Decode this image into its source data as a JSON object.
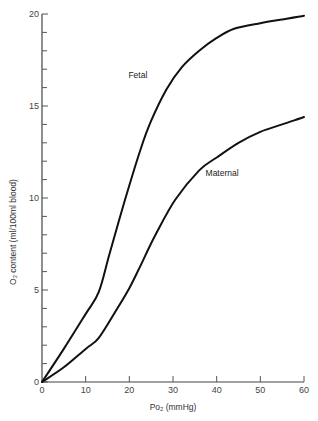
{
  "chart_data": {
    "type": "line",
    "title": "",
    "xlabel": "Po₂ (mmHg)",
    "ylabel": "O₂ content (ml/100ml blood)",
    "xlim": [
      0,
      60
    ],
    "ylim": [
      0,
      20
    ],
    "x_ticks": [
      0,
      10,
      20,
      30,
      40,
      50,
      60
    ],
    "y_ticks": [
      0,
      5,
      10,
      15,
      20
    ],
    "y_minor_step": 1,
    "grid": false,
    "legend": "inline labels on curves",
    "series": [
      {
        "name": "Fetal",
        "label_position": {
          "x": 23,
          "y": 16.5
        },
        "x": [
          0,
          5,
          10,
          13,
          15.5,
          19,
          22.5,
          25,
          28.5,
          32,
          36,
          40,
          44,
          50,
          55,
          60
        ],
        "values": [
          0,
          1.8,
          3.7,
          4.9,
          7.0,
          9.9,
          12.6,
          14.2,
          15.9,
          17.1,
          18.0,
          18.7,
          19.2,
          19.5,
          19.7,
          19.9
        ]
      },
      {
        "name": "Maternal",
        "label_position": {
          "x": 37,
          "y": 11.2
        },
        "x": [
          0,
          5,
          10,
          13,
          17,
          20,
          22.5,
          26,
          30.5,
          36,
          40,
          45,
          50,
          55,
          60
        ],
        "values": [
          0,
          0.8,
          1.8,
          2.4,
          3.9,
          5.1,
          6.3,
          8.0,
          9.9,
          11.5,
          12.2,
          13.0,
          13.6,
          14.0,
          14.4
        ]
      }
    ]
  },
  "axes": {
    "x_title": "Po₂ (mmHg)",
    "y_title": "O₂ content (ml/100ml blood)",
    "x_tick_labels": [
      "0",
      "10",
      "20",
      "30",
      "40",
      "50",
      "60"
    ],
    "y_tick_labels": [
      "0",
      "5",
      "10",
      "15",
      "20"
    ]
  },
  "labels": {
    "fetal": "Fetal",
    "maternal": "Maternal"
  },
  "colors": {
    "curve": "#111111",
    "axis": "#444444",
    "text": "#333333",
    "background": "#ffffff"
  }
}
